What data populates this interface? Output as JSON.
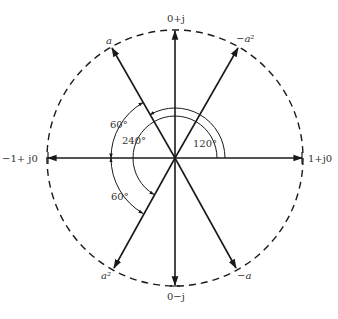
{
  "diagram": {
    "type": "phasor-diagram",
    "unit_circle": {
      "style": "dashed"
    },
    "phasors": [
      {
        "id": "one",
        "label": "1+j0",
        "angle_deg": 0
      },
      {
        "id": "j",
        "label": "0+j",
        "angle_deg": 90
      },
      {
        "id": "a",
        "label": "a",
        "angle_deg": 120
      },
      {
        "id": "neg-a2",
        "label": "−a²",
        "angle_deg": 60
      },
      {
        "id": "neg-one",
        "label": "−1+ j0",
        "angle_deg": 180
      },
      {
        "id": "a2",
        "label": "a²",
        "angle_deg": 240
      },
      {
        "id": "neg-j",
        "label": "0−j",
        "angle_deg": 270
      },
      {
        "id": "neg-a",
        "label": "−a",
        "angle_deg": 300
      }
    ],
    "angle_labels": {
      "a120": "120°",
      "a240": "240°",
      "a60_top": "60°",
      "a60_bottom": "60°"
    },
    "colors": {
      "line": "#1a1a1a",
      "text": "#333333",
      "background": "#ffffff"
    }
  }
}
